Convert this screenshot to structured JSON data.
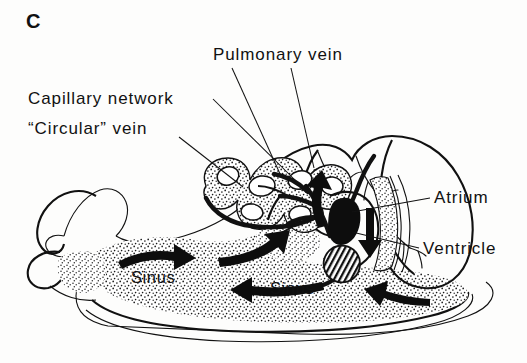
{
  "figure": {
    "panel_label": "C",
    "background_color": "#fdfdfc",
    "ink_color": "#111111"
  },
  "labels": {
    "capillary_network": "Capillary network",
    "circular_vein": "“Circular” vein",
    "pulmonary_vein": "Pulmonary vein",
    "atrium": "Atrium",
    "ventricle": "Ventricle",
    "sinus_left": "Sinus",
    "sinus_right": "Sinus"
  },
  "label_positions": {
    "panel_label": {
      "x": 26,
      "y": 28
    },
    "capillary_network": {
      "x": 28,
      "y": 104
    },
    "circular_vein": {
      "x": 28,
      "y": 134
    },
    "pulmonary_vein": {
      "x": 213,
      "y": 60
    },
    "atrium": {
      "x": 434,
      "y": 203
    },
    "ventricle": {
      "x": 423,
      "y": 254
    },
    "sinus_left": {
      "x": 131,
      "y": 283
    },
    "sinus_right": {
      "x": 270,
      "y": 294
    }
  },
  "leader_lines": [
    {
      "name": "capillary-network-leader",
      "d": "M 213 99 L 296 181"
    },
    {
      "name": "circular-vein-leader",
      "d": "M 179 137 L 243 187"
    },
    {
      "name": "pulmonary-vein-leader",
      "d": "M 232 68 L 281 176"
    },
    {
      "name": "pulmonary-vein-leader-2",
      "d": "M 291 68 L 314 168"
    },
    {
      "name": "atrium-leader",
      "d": "M 430 198 L 352 212"
    },
    {
      "name": "ventricle-leader",
      "d": "M 419 248 L 352 232"
    }
  ],
  "anatomy": {
    "regions": [
      {
        "name": "head-and-tentacles",
        "stipple": false
      },
      {
        "name": "foot-sole",
        "stipple": false
      },
      {
        "name": "visceral-mass-shell",
        "stipple": false
      },
      {
        "name": "haemocoel-sinus",
        "stipple": true
      },
      {
        "name": "lung-mantle-vessels",
        "stipple": false
      },
      {
        "name": "capillary-network",
        "stipple": true
      }
    ],
    "flow_arrows": [
      {
        "name": "sinus-flow-arrow-right",
        "direction": "right"
      },
      {
        "name": "sinus-flow-arrow-left",
        "direction": "left"
      },
      {
        "name": "sinus-flow-arrow-return",
        "direction": "left"
      },
      {
        "name": "heart-flow-arrow-down",
        "direction": "down"
      },
      {
        "name": "pulmonary-flow-arrow-up",
        "direction": "up"
      }
    ]
  }
}
